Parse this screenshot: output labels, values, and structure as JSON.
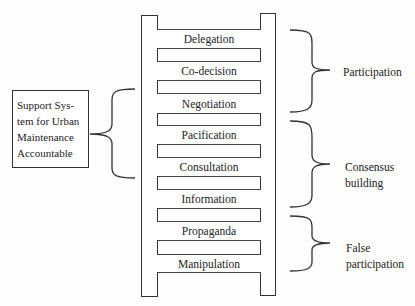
{
  "diagram": {
    "type": "ladder",
    "rungs": [
      {
        "label": "Delegation",
        "top": 29,
        "height": 19
      },
      {
        "label": "Co-decision",
        "top": 61,
        "height": 19
      },
      {
        "label": "Negotiation",
        "top": 93,
        "height": 20
      },
      {
        "label": "Pacification",
        "top": 125,
        "height": 19
      },
      {
        "label": "Consultation",
        "top": 157,
        "height": 19
      },
      {
        "label": "Information",
        "top": 189,
        "height": 19
      },
      {
        "label": "Propaganda",
        "top": 221,
        "height": 19
      },
      {
        "label": "Manipulation",
        "top": 254,
        "height": 18
      }
    ],
    "groups": [
      {
        "label": "Participation",
        "covers": [
          "Delegation",
          "Co-decision",
          "Negotiation"
        ]
      },
      {
        "label_line1": "Consensus",
        "label_line2": "building",
        "covers": [
          "Pacification",
          "Consultation",
          "Information"
        ]
      },
      {
        "label_line1": "False",
        "label_line2": "participation",
        "covers": [
          "Propaganda",
          "Manipulation"
        ]
      }
    ],
    "side_box": {
      "lines": [
        "Support Sys-",
        "tem for Urban",
        "Maintenance",
        "Accountable"
      ],
      "covers": [
        "Negotiation",
        "Pacification",
        "Consultation"
      ]
    }
  }
}
